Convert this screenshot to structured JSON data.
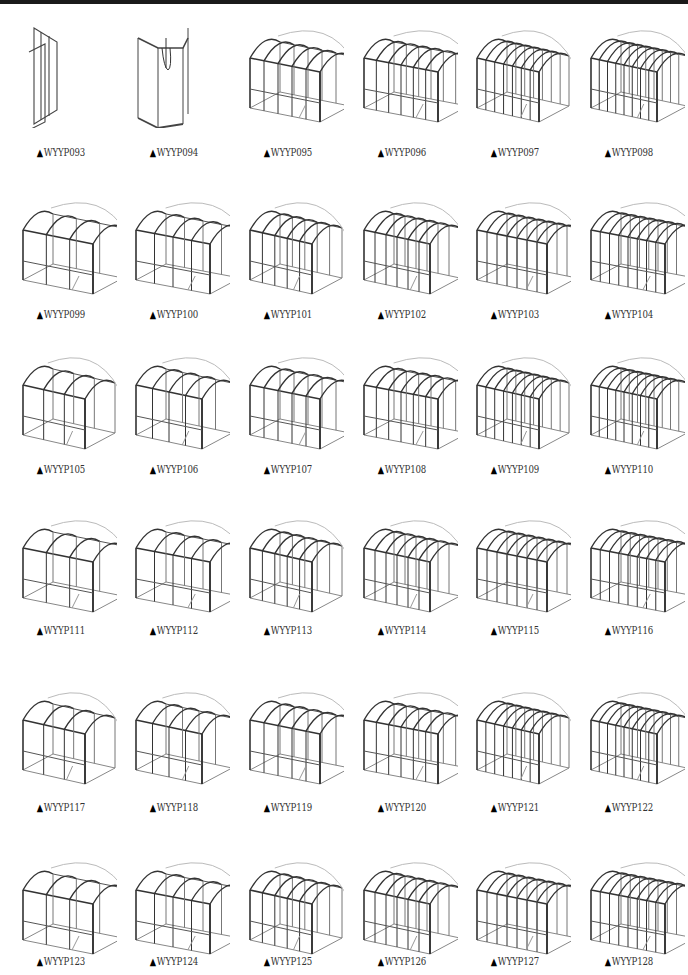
{
  "page": {
    "marker_glyph": "▲",
    "rows": [
      {
        "caption_y": 153,
        "fig_y": 18,
        "items": [
          "WYYP093",
          "WYYP094",
          "WYYP095",
          "WYYP096",
          "WYYP097",
          "WYYP098"
        ]
      },
      {
        "caption_y": 315,
        "fig_y": 190,
        "items": [
          "WYYP099",
          "WYYP100",
          "WYYP101",
          "WYYP102",
          "WYYP103",
          "WYYP104"
        ]
      },
      {
        "caption_y": 470,
        "fig_y": 345,
        "items": [
          "WYYP105",
          "WYYP106",
          "WYYP107",
          "WYYP108",
          "WYYP109",
          "WYYP110"
        ]
      },
      {
        "caption_y": 631,
        "fig_y": 508,
        "items": [
          "WYYP111",
          "WYYP112",
          "WYYP113",
          "WYYP114",
          "WYYP115",
          "WYYP116"
        ]
      },
      {
        "caption_y": 808,
        "fig_y": 680,
        "items": [
          "WYYP117",
          "WYYP118",
          "WYYP119",
          "WYYP120",
          "WYYP121",
          "WYYP122"
        ]
      },
      {
        "caption_y": 962,
        "fig_y": 850,
        "items": [
          "WYYP123",
          "WYYP124",
          "WYYP125",
          "WYYP126",
          "WYYP127",
          "WYYP128"
        ]
      }
    ],
    "column_x": [
      5,
      118,
      232,
      346,
      459,
      573
    ],
    "figure_types": {
      "WYYP093": "panel",
      "WYYP094": "corner-shower",
      "default": "arched-enclosure"
    }
  }
}
